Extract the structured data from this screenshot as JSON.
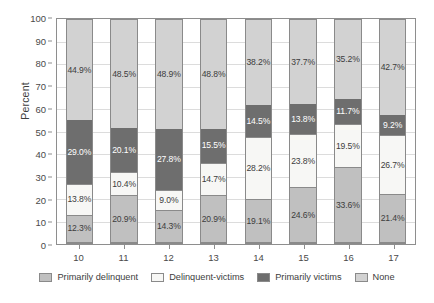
{
  "chart_data": {
    "type": "bar",
    "subtype": "stacked-100-percent",
    "title": "",
    "xlabel": "",
    "ylabel": "Percent",
    "ylim": [
      0,
      100
    ],
    "ytick_step": 10,
    "yticks": [
      100,
      90,
      80,
      70,
      60,
      50,
      40,
      30,
      20,
      10,
      0
    ],
    "grid": true,
    "grid_axis": "y",
    "legend_position": "bottom",
    "value_suffix": "%",
    "categories": [
      "10",
      "11",
      "12",
      "13",
      "14",
      "15",
      "16",
      "17"
    ],
    "series": [
      {
        "name": "Primarily delinquent",
        "color": "#c0c0c0",
        "values": [
          12.3,
          20.9,
          14.3,
          20.9,
          19.1,
          24.6,
          33.6,
          21.4
        ],
        "labels": [
          "12.3%",
          "20.9%",
          "14.3%",
          "20.9%",
          "19.1%",
          "24.6%",
          "33.6%",
          "21.4%"
        ]
      },
      {
        "name": "Delinquent-victims",
        "color": "#f7f7f5",
        "values": [
          13.8,
          10.4,
          9.0,
          14.7,
          28.2,
          23.8,
          19.5,
          26.7
        ],
        "labels": [
          "13.8%",
          "10.4%",
          "9.0%",
          "14.7%",
          "28.2%",
          "23.8%",
          "19.5%",
          "26.7%"
        ]
      },
      {
        "name": "Primarily victims",
        "color": "#6e6e6e",
        "values": [
          29.0,
          20.1,
          27.8,
          15.5,
          14.5,
          13.8,
          11.7,
          9.2
        ],
        "labels": [
          "29.0%",
          "20.1%",
          "27.8%",
          "15.5%",
          "14.5%",
          "13.8%",
          "11.7%",
          "9.2%"
        ]
      },
      {
        "name": "None",
        "color": "#d2d2d2",
        "values": [
          44.9,
          48.5,
          48.9,
          48.8,
          38.2,
          37.7,
          35.2,
          42.7
        ],
        "labels": [
          "44.9%",
          "48.5%",
          "48.9%",
          "48.8%",
          "38.2%",
          "37.7%",
          "35.2%",
          "42.7%"
        ]
      }
    ]
  }
}
